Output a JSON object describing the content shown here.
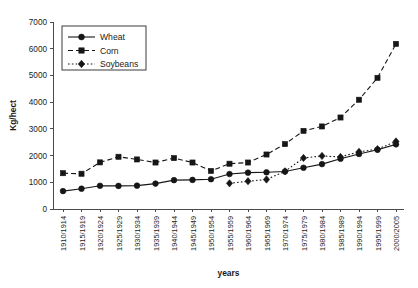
{
  "chart_data": {
    "type": "line",
    "title": "",
    "xlabel": "years",
    "ylabel": "Kg/hect",
    "ylim": [
      0,
      7000
    ],
    "ytick_step": 1000,
    "grid": false,
    "legend_position": "top-left",
    "yticks": [
      "0",
      "1000",
      "2000",
      "3000",
      "4000",
      "5000",
      "6000",
      "7000"
    ],
    "categories": [
      "1910/1914",
      "1915/1919",
      "1920/1924",
      "1925/1929",
      "1930/1934",
      "1935/1939",
      "1940/1944",
      "1945/1949",
      "1950/1954",
      "1955/1959",
      "1960/1964",
      "1965/1969",
      "1970/1974",
      "1975/1979",
      "1980/1984",
      "1985/1989",
      "1990/1994",
      "1995/1999",
      "2000/2005"
    ],
    "series": [
      {
        "name": "Wheat",
        "marker": "circle",
        "dash": "solid",
        "color": "#161616",
        "values": [
          670,
          760,
          870,
          865,
          875,
          950,
          1080,
          1090,
          1115,
          1310,
          1360,
          1375,
          1405,
          1545,
          1680,
          1880,
          2060,
          2220,
          2420
        ]
      },
      {
        "name": "Corn",
        "marker": "square",
        "dash": "dashed",
        "color": "#161616",
        "values": [
          1340,
          1320,
          1745,
          1955,
          1855,
          1740,
          1905,
          1740,
          1425,
          1695,
          1740,
          2040,
          2430,
          2925,
          3090,
          3425,
          4090,
          4910,
          6180
        ]
      },
      {
        "name": "Soybeans",
        "marker": "diamond",
        "dash": "dotted",
        "color": "#161616",
        "values": [
          null,
          null,
          null,
          null,
          null,
          null,
          null,
          null,
          null,
          960,
          1040,
          1105,
          1410,
          1910,
          1985,
          1950,
          2140,
          2240,
          2530
        ]
      }
    ]
  },
  "legend": {
    "items": [
      {
        "label": "Wheat"
      },
      {
        "label": "Corn"
      },
      {
        "label": "Soybeans"
      }
    ]
  }
}
